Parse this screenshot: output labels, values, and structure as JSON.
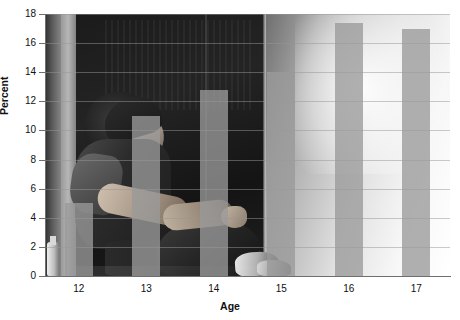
{
  "chart_data": {
    "type": "bar",
    "title": "",
    "subtitle": "",
    "xlabel": "Age",
    "ylabel": "Percent",
    "categories": [
      "12",
      "13",
      "14",
      "15",
      "16",
      "17"
    ],
    "values": [
      5.0,
      11.0,
      12.8,
      14.0,
      17.4,
      17.0
    ],
    "series": [
      {
        "name": "Percent",
        "values": [
          5.0,
          11.0,
          12.8,
          14.0,
          17.4,
          17.0
        ]
      }
    ],
    "ylim": [
      0,
      18
    ],
    "ytick_values": [
      0,
      2,
      4,
      6,
      8,
      10,
      12,
      14,
      16,
      18
    ],
    "ytick_labels": [
      "0",
      "2",
      "4",
      "6",
      "8",
      "10",
      "12",
      "14",
      "16",
      "18"
    ],
    "xtick_labels": [
      "12",
      "13",
      "14",
      "15",
      "16",
      "17"
    ],
    "grid": true,
    "grid_axis": "y",
    "legend": false,
    "legend_position": "none",
    "bar_color": "#9a9a9a",
    "bar_opacity": 0.78,
    "axis_color": "#6f6f6f",
    "grid_color": "#969696",
    "text_color": "#111111",
    "background": "photograph",
    "background_description": "Grayscale photo of a teenager sitting on the floor in a doorway, head lowered, arms resting on knees",
    "annotations": []
  }
}
